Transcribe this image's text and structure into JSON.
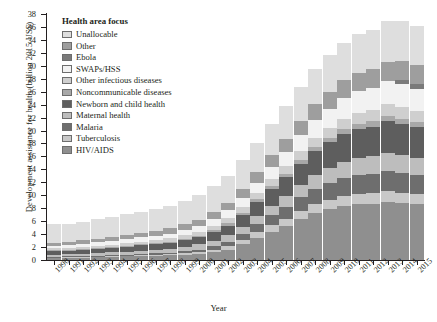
{
  "chart_data": {
    "type": "bar",
    "stacked": true,
    "title": "",
    "xlabel": "Year",
    "ylabel": "Development assistance for health (billion 2015 US$)",
    "ylim": [
      0,
      38
    ],
    "ytick_step": 2,
    "yticks": [
      0,
      2,
      4,
      6,
      8,
      10,
      12,
      14,
      16,
      18,
      20,
      22,
      24,
      26,
      28,
      30,
      32,
      34,
      36,
      38
    ],
    "grid": false,
    "legend_position": "inside-top-left",
    "legend_title": "Health area focus",
    "categories": [
      "1990",
      "1991",
      "1992",
      "1993",
      "1994",
      "1995",
      "1996",
      "1997",
      "1998",
      "1999",
      "2000",
      "2001",
      "2002",
      "2003",
      "2004",
      "2005",
      "2006",
      "2007",
      "2008",
      "2009",
      "2010",
      "2011",
      "2012",
      "2013",
      "2014",
      "2015"
    ],
    "series": [
      {
        "name": "HIV/AIDS",
        "color": "#8f8f8f",
        "values": [
          0.3,
          0.35,
          0.4,
          0.45,
          0.5,
          0.55,
          0.6,
          0.65,
          0.7,
          0.8,
          0.9,
          1.2,
          1.6,
          2.4,
          3.4,
          4.4,
          5.3,
          6.4,
          7.3,
          7.9,
          8.4,
          8.6,
          8.7,
          9.0,
          8.8,
          8.6
        ]
      },
      {
        "name": "Tuberculosis",
        "color": "#c8c8c8",
        "values": [
          0.1,
          0.1,
          0.12,
          0.12,
          0.15,
          0.15,
          0.18,
          0.2,
          0.22,
          0.25,
          0.3,
          0.4,
          0.5,
          0.7,
          0.9,
          1.0,
          1.1,
          1.2,
          1.3,
          1.4,
          1.5,
          1.6,
          1.6,
          1.7,
          1.6,
          1.6
        ]
      },
      {
        "name": "Malaria",
        "color": "#6e6e6e",
        "values": [
          0.1,
          0.1,
          0.1,
          0.12,
          0.13,
          0.15,
          0.18,
          0.2,
          0.22,
          0.3,
          0.4,
          0.5,
          0.7,
          0.9,
          1.2,
          1.5,
          1.8,
          2.1,
          2.4,
          2.6,
          2.8,
          2.9,
          3.0,
          3.1,
          3.0,
          2.9
        ]
      },
      {
        "name": "Maternal health",
        "color": "#bdbdbd",
        "values": [
          0.3,
          0.32,
          0.35,
          0.38,
          0.4,
          0.45,
          0.5,
          0.55,
          0.6,
          0.7,
          0.8,
          0.9,
          1.0,
          1.1,
          1.3,
          1.5,
          1.7,
          1.9,
          2.1,
          2.3,
          2.5,
          2.6,
          2.7,
          2.8,
          2.8,
          2.7
        ]
      },
      {
        "name": "Newborn and child health",
        "color": "#5e5e5e",
        "values": [
          0.6,
          0.62,
          0.65,
          0.68,
          0.7,
          0.75,
          0.8,
          0.85,
          0.9,
          1.0,
          1.1,
          1.3,
          1.5,
          1.8,
          2.1,
          2.5,
          2.9,
          3.3,
          3.7,
          4.0,
          4.3,
          4.5,
          4.6,
          4.8,
          4.8,
          4.7
        ]
      },
      {
        "name": "Noncommunicable diseases",
        "color": "#a8a8a8",
        "values": [
          0.1,
          0.1,
          0.1,
          0.12,
          0.12,
          0.15,
          0.15,
          0.18,
          0.2,
          0.2,
          0.25,
          0.3,
          0.35,
          0.4,
          0.45,
          0.5,
          0.55,
          0.6,
          0.65,
          0.7,
          0.75,
          0.8,
          0.8,
          0.85,
          0.85,
          0.8
        ]
      },
      {
        "name": "Other infectious diseases",
        "color": "#cfcfcf",
        "values": [
          0.3,
          0.3,
          0.32,
          0.35,
          0.38,
          0.4,
          0.42,
          0.45,
          0.5,
          0.55,
          0.6,
          0.7,
          0.8,
          0.9,
          1.0,
          1.1,
          1.2,
          1.3,
          1.4,
          1.5,
          1.6,
          1.7,
          1.7,
          1.8,
          1.8,
          1.7
        ]
      },
      {
        "name": "SWAPs/HSS",
        "color": "#f2f2f2",
        "values": [
          0.4,
          0.42,
          0.45,
          0.5,
          0.55,
          0.6,
          0.65,
          0.7,
          0.75,
          0.8,
          0.9,
          1.0,
          1.2,
          1.4,
          1.6,
          1.9,
          2.2,
          2.5,
          2.8,
          3.0,
          3.2,
          3.4,
          3.5,
          3.6,
          3.5,
          3.4
        ]
      },
      {
        "name": "Ebola",
        "color": "#7a7a7a",
        "values": [
          0,
          0,
          0,
          0,
          0,
          0,
          0,
          0,
          0,
          0,
          0,
          0,
          0,
          0,
          0,
          0,
          0,
          0,
          0,
          0,
          0,
          0,
          0,
          0,
          0.6,
          0.8
        ]
      },
      {
        "name": "Other",
        "color": "#9e9e9e",
        "values": [
          0.5,
          0.52,
          0.55,
          0.58,
          0.6,
          0.65,
          0.7,
          0.75,
          0.8,
          0.9,
          1.0,
          1.1,
          1.2,
          1.4,
          1.6,
          1.8,
          2.0,
          2.2,
          2.4,
          2.6,
          2.7,
          2.8,
          2.9,
          3.0,
          3.0,
          2.9
        ]
      },
      {
        "name": "Unallocable",
        "color": "#dedede",
        "values": [
          2.8,
          2.8,
          2.9,
          3.0,
          3.1,
          3.2,
          3.3,
          3.4,
          3.5,
          3.6,
          3.8,
          4.0,
          4.2,
          4.4,
          4.6,
          4.8,
          5.0,
          5.2,
          5.4,
          5.6,
          5.8,
          6.0,
          6.1,
          6.3,
          6.2,
          6.1
        ]
      }
    ],
    "totals": [
      5.5,
      5.63,
      5.94,
      6.3,
      6.63,
      7.05,
      7.46,
      7.93,
      8.39,
      9.1,
      10.05,
      11.4,
      13.05,
      15.4,
      18.15,
      21.0,
      23.75,
      26.65,
      29.45,
      31.6,
      33.55,
      34.9,
      35.6,
      36.95,
      37.0,
      36.2
    ]
  }
}
